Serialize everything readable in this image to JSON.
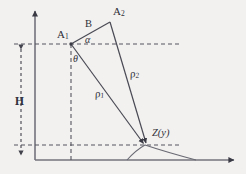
{
  "figure": {
    "type": "geometry-diagram",
    "background_color": "#f2f1ef",
    "stroke_color": "#4a4a55",
    "axis_color": "#73737d",
    "text_color": "#2f2f38"
  },
  "labels": {
    "a1": "A",
    "a1_sub": "1",
    "a2": "A",
    "a2_sub": "2",
    "baseline_b": "B",
    "alpha": "α",
    "theta": "θ",
    "rho1": "ρ",
    "rho1_sub": "1",
    "rho2": "ρ",
    "rho2_sub": "2",
    "height": "H",
    "target": "Z(y)"
  },
  "geometry": {
    "origin": [
      35,
      160
    ],
    "vertical_axis_top": [
      35,
      8
    ],
    "horizontal_axis_right": [
      238,
      160
    ],
    "point_a1": [
      71,
      44
    ],
    "point_a2": [
      110,
      22
    ],
    "point_z": [
      145,
      145
    ],
    "upper_dashed_y": 44,
    "lower_dashed_y": 145,
    "dashed_x_end": 180,
    "hump_start_x": 127,
    "hump_end_x": 196,
    "height_dim_x": 21
  }
}
